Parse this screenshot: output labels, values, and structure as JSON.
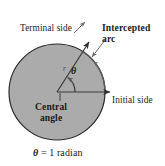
{
  "figure": {
    "caption": "θ = 1 radian",
    "caption_symbol": "θ",
    "caption_rest": " = 1 radian",
    "labels": {
      "terminal_side": "Terminal side",
      "intercepted_arc_line1": "Intercepted",
      "intercepted_arc_line2": "arc",
      "initial_side": "Initial side",
      "central_angle_line1": "Central",
      "central_angle_line2": "angle",
      "theta": "θ",
      "radius_terminal": "r",
      "radius_arc": "r"
    },
    "colors": {
      "disk_fill": "#ababab",
      "disk_stroke": "#2b2b2b",
      "ray_stroke": "#3a3a3a",
      "leader_stroke": "#6e6e6e",
      "text": "#1c1c1c",
      "background": "#ffffff"
    },
    "geometry": {
      "center_x": 57,
      "center_y": 92,
      "radius": 48,
      "initial_side_angle_deg": 0,
      "terminal_side_angle_deg": 57.3,
      "angle_value_radians": 1
    }
  }
}
